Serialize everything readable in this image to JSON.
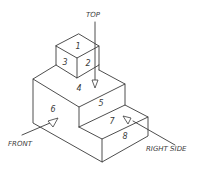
{
  "diagram": {
    "type": "isometric-view",
    "view_labels": {
      "top": "TOP",
      "front": "FRONT",
      "right_side": "RIGHT SIDE"
    },
    "surface_numbers": {
      "s1": "1",
      "s2": "2",
      "s3": "3",
      "s4": "4",
      "s5": "5",
      "s6": "6",
      "s7": "7",
      "s8": "8"
    },
    "line_color": "#3a3a3a",
    "background": "#ffffff"
  }
}
